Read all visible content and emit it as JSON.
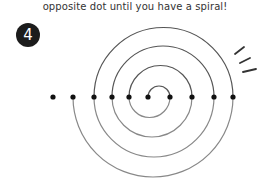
{
  "caption": "opposite dot until you have a spiral!",
  "step": {
    "number": "4"
  },
  "diagram": {
    "dot_y": 97,
    "dots_x": [
      53,
      73,
      94,
      112,
      129,
      148,
      170,
      192,
      214,
      233
    ],
    "line_color": "#555555",
    "dot_color": "#111111"
  }
}
